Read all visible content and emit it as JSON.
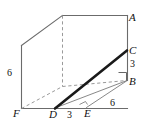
{
  "figure": {
    "type": "geometry-diagram",
    "colors": {
      "solid_edge": "#6b6b6b",
      "hidden_edge": "#9a9a9a",
      "emphasis_line": "#1a1a1a",
      "thin_line": "#7a7a7a",
      "label_text": "#111111",
      "background": "#ffffff"
    },
    "vertex_labels": [
      {
        "id": "A",
        "text": "A",
        "x": 129,
        "y": 12
      },
      {
        "id": "C",
        "text": "C",
        "x": 129,
        "y": 45
      },
      {
        "id": "B",
        "text": "B",
        "x": 129,
        "y": 76
      },
      {
        "id": "F",
        "text": "F",
        "x": 13,
        "y": 108
      },
      {
        "id": "D",
        "text": "D",
        "x": 49,
        "y": 109
      },
      {
        "id": "E",
        "text": "E",
        "x": 84,
        "y": 108
      }
    ],
    "measurements": [
      {
        "id": "left-height",
        "text": "6",
        "x": 7,
        "y": 68,
        "edge": "FA-left-vertical"
      },
      {
        "id": "right-CB",
        "text": "3",
        "x": 130,
        "y": 59,
        "edge": "CB"
      },
      {
        "id": "right-EB",
        "text": "6",
        "x": 110,
        "y": 98,
        "edge": "EB"
      },
      {
        "id": "bottom-DE",
        "text": "3",
        "x": 67,
        "y": 110,
        "edge": "DE"
      }
    ],
    "right_angle_marks": [
      {
        "id": "angle-at-B",
        "vertex": "B"
      },
      {
        "id": "angle-at-E",
        "vertex": "E"
      }
    ],
    "emphasis_segment": {
      "from": "D",
      "to": "C"
    },
    "thin_segments": [
      {
        "from": "D",
        "to": "B"
      },
      {
        "from": "E",
        "to": "B"
      }
    ]
  }
}
